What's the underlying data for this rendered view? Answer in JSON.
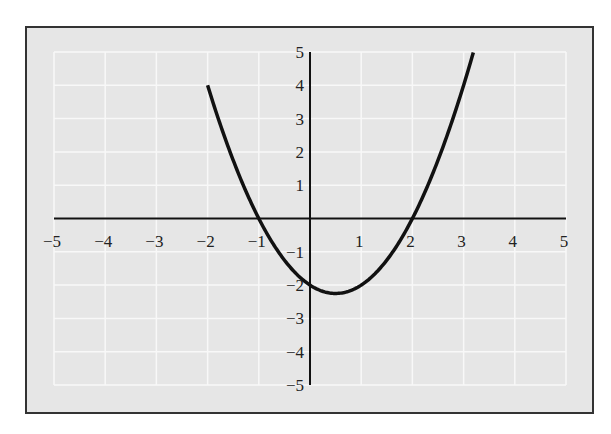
{
  "chart_data": {
    "type": "line",
    "title": "",
    "xlabel": "",
    "ylabel": "",
    "function": "y = x^2 - x - 2",
    "xlim": [
      -5,
      5
    ],
    "ylim": [
      -5,
      5
    ],
    "grid": true,
    "x_ticks": [
      "−5",
      "−4",
      "−3",
      "−2",
      "−1",
      "1",
      "2",
      "3",
      "4",
      "5"
    ],
    "y_ticks": [
      "5",
      "4",
      "3",
      "2",
      "1",
      "−1",
      "−2",
      "−3",
      "−4",
      "−5"
    ],
    "series": [
      {
        "name": "parabola",
        "x": [
          -2,
          -1.5,
          -1,
          -0.5,
          0,
          0.5,
          1,
          1.5,
          2,
          2.5,
          3,
          3.19
        ],
        "y": [
          4,
          1.75,
          0,
          -1.25,
          -2,
          -2.25,
          -2,
          -1.25,
          0,
          1.75,
          4,
          4.99
        ]
      }
    ],
    "key_points": {
      "x_intercepts": [
        -1,
        2
      ],
      "y_intercept": -2,
      "vertex": [
        0.5,
        -2.25
      ]
    }
  },
  "colors": {
    "panel_bg": "#e6e6e6",
    "grid": "#f8f8f8",
    "frame": "#333333",
    "curve": "#111111",
    "axes": "#111111"
  }
}
